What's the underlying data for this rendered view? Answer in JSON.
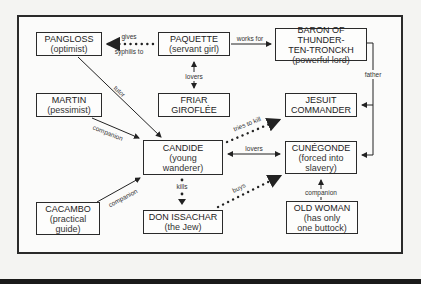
{
  "diagram": {
    "type": "character-relationship-map",
    "nodes": [
      {
        "id": "pangloss",
        "name": "PANGLOSS",
        "desc": "(optimist)"
      },
      {
        "id": "paquette",
        "name": "PAQUETTE",
        "desc": "(servant girl)"
      },
      {
        "id": "baron",
        "name": "BARON OF THUNDER-",
        "name2": "TEN-TRONCKH",
        "desc": "(powerful lord)"
      },
      {
        "id": "martin",
        "name": "MARTIN",
        "desc": "(pessimist)"
      },
      {
        "id": "friar",
        "name": "FRIAR",
        "name2": "GIROFLÉE"
      },
      {
        "id": "jesuit",
        "name": "JESUIT",
        "name2": "COMMANDER"
      },
      {
        "id": "candide",
        "name": "CANDIDE",
        "desc": "(young",
        "desc2": "wanderer)"
      },
      {
        "id": "cunegonde",
        "name": "CUNÉGONDE",
        "desc": "(forced into",
        "desc2": "slavery)"
      },
      {
        "id": "cacambo",
        "name": "CACAMBO",
        "desc": "(practical",
        "desc2": "guide)"
      },
      {
        "id": "don",
        "name": "DON ISSACHAR",
        "desc": "(the Jew)"
      },
      {
        "id": "oldwoman",
        "name": "OLD WOMAN",
        "desc": "(has only",
        "desc2": "one buttock)"
      }
    ],
    "edges": {
      "gives1": "gives",
      "gives2": "syphilis to",
      "works_for": "works for",
      "lovers_top": "lovers",
      "father": "father",
      "tutor": "tutor",
      "companion_martin": "companion",
      "tries_to_kill": "tries to kill",
      "lovers_mid": "lovers",
      "kills": "kills",
      "companion_cacambo": "companion",
      "buys": "buys",
      "companion_old": "companion"
    }
  }
}
